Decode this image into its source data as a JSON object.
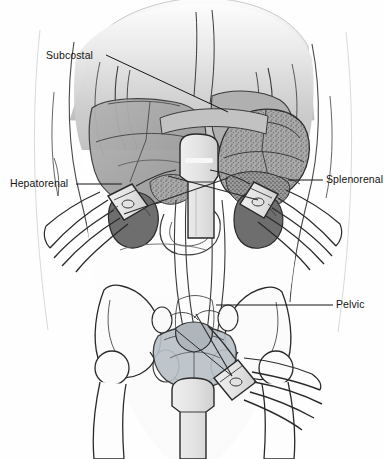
{
  "figure": {
    "background_color": "#fefefe",
    "width": 384,
    "height": 459
  },
  "labels": [
    {
      "id": "subcostal",
      "text": "Subcostal",
      "x": 46,
      "y": 50,
      "anchor": "left"
    },
    {
      "id": "hepatorenal",
      "text": "Hepatorenal",
      "x": 10,
      "y": 178,
      "anchor": "left"
    },
    {
      "id": "splenorenal",
      "text": "Splenorenal",
      "x": 326,
      "y": 174,
      "anchor": "left"
    },
    {
      "id": "pelvic",
      "text": "Pelvic",
      "x": 336,
      "y": 299,
      "anchor": "left"
    }
  ],
  "leader_lines": [
    {
      "id": "subcostal-leader",
      "from": [
        106,
        55
      ],
      "to": [
        228,
        112
      ]
    },
    {
      "id": "hepatorenal-leader",
      "from": [
        76,
        184
      ],
      "to": [
        122,
        184
      ]
    },
    {
      "id": "splenorenal-leader",
      "from": [
        323,
        180
      ],
      "to": [
        288,
        180
      ]
    },
    {
      "id": "pelvic-leader",
      "from": [
        333,
        305
      ],
      "to": [
        216,
        305
      ]
    }
  ],
  "anatomy": [
    {
      "id": "torso",
      "label": "Torso outline"
    },
    {
      "id": "rib-cage",
      "label": "Rib cage margin"
    },
    {
      "id": "liver",
      "label": "Liver"
    },
    {
      "id": "stomach-spleen",
      "label": "Stomach and spleen"
    },
    {
      "id": "left-kidney",
      "label": "Left kidney"
    },
    {
      "id": "right-kidney",
      "label": "Right kidney"
    },
    {
      "id": "pelvic-bone",
      "label": "Pelvic bone"
    },
    {
      "id": "bladder",
      "label": "Urinary bladder"
    },
    {
      "id": "uterus",
      "label": "Uterus"
    },
    {
      "id": "femur-left",
      "label": "Left femur"
    },
    {
      "id": "femur-right",
      "label": "Right femur"
    }
  ],
  "probes": [
    {
      "id": "probe-subcostal",
      "label": "Subcostal transducer"
    },
    {
      "id": "probe-hepatorenal",
      "label": "Hepatorenal transducer with hand"
    },
    {
      "id": "probe-splenorenal",
      "label": "Splenorenal transducer with hand"
    },
    {
      "id": "probe-pelvic",
      "label": "Pelvic transducer with hand"
    }
  ],
  "palette": {
    "ink": "#141414",
    "outline": "#2a2a2a",
    "skin_light": "#f2f2f2",
    "skin_mid": "#c9c9c9",
    "skin_dark": "#a8a8a8",
    "organ_liver": "#9e9e9e",
    "organ_spleen": "#8d8d8d",
    "organ_kidney": "#707070",
    "bladder": "#b6bec4",
    "probe_body": "#e4e4e4",
    "background": "#fefefe"
  }
}
